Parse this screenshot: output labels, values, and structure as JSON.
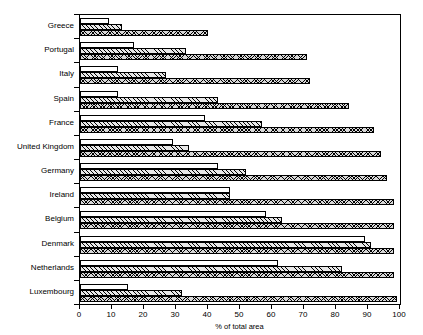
{
  "chart_data": {
    "type": "bar",
    "orientation": "horizontal",
    "title": "",
    "xlabel": "% of total area",
    "ylabel": "",
    "xlim": [
      0,
      100
    ],
    "xticks": [
      0,
      10,
      20,
      30,
      40,
      50,
      60,
      70,
      80,
      90,
      100
    ],
    "grid": false,
    "legend": "none",
    "categories": [
      "Greece",
      "Portugal",
      "Italy",
      "Spain",
      "France",
      "United Kingdom",
      "Germany",
      "Ireland",
      "Belgium",
      "Denmark",
      "Netherlands",
      "Luxembourg"
    ],
    "series": [
      {
        "name": "series-1",
        "pattern": "solid-white",
        "values": [
          9,
          17,
          12,
          12,
          39,
          29,
          43,
          47,
          58,
          89,
          62,
          15
        ]
      },
      {
        "name": "series-2",
        "pattern": "diagonal-hatch",
        "values": [
          13,
          33,
          27,
          43,
          57,
          34,
          52,
          47,
          63,
          91,
          82,
          32
        ]
      },
      {
        "name": "series-3",
        "pattern": "crosshatch",
        "values": [
          40,
          71,
          72,
          84,
          92,
          94,
          96,
          98,
          98,
          98,
          98,
          99
        ]
      }
    ]
  }
}
